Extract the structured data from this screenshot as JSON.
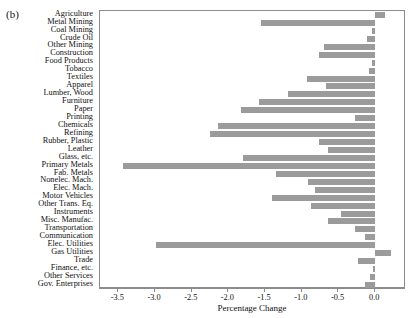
{
  "figure": {
    "panel_label": "(b)"
  },
  "chart_data": {
    "type": "bar",
    "orientation": "horizontal",
    "title": "",
    "subtitle": "",
    "xlabel": "Percentage Change",
    "ylabel": "",
    "xlim": [
      -3.75,
      0.42
    ],
    "ylim": [
      0,
      33
    ],
    "grid": false,
    "legend": null,
    "bar_color": "#9b9b9b",
    "axis_color": "#8c8c8c",
    "xticks": [
      -3.5,
      -3.0,
      -2.5,
      -2.0,
      -1.5,
      -1.0,
      -0.5,
      0.0
    ],
    "xticklabels": [
      "-3.5",
      "-3.0",
      "-2.5",
      "-2.0",
      "-1.5",
      "-1.0",
      "-0.5",
      "0.0"
    ],
    "categories": [
      "Agriculture",
      "Metal Mining",
      "Coal Mining",
      "Crude Oil",
      "Other Mining",
      "Construction",
      "Food Products",
      "Tobacco",
      "Textiles",
      "Apparel",
      "Lumber, Wood",
      "Furniture",
      "Paper",
      "Printing",
      "Chemicals",
      "Refining",
      "Rubber, Plastic",
      "Leather",
      "Glass, etc.",
      "Primary Metals",
      "Fab. Metals",
      "Nonelec. Mach.",
      "Elec. Mach.",
      "Motor Vehicles",
      "Other Trans. Eq.",
      "Instruments",
      "Misc. Manufac.",
      "Transportation",
      "Communication",
      "Elec. Utilities",
      "Gas Utilities",
      "Trade",
      "Finance, etc.",
      "Other Services",
      "Gov. Enterprises"
    ],
    "values": [
      0.13,
      -1.55,
      -0.05,
      -0.11,
      -0.7,
      -0.76,
      -0.05,
      -0.09,
      -0.93,
      -0.67,
      -1.19,
      -1.59,
      -1.83,
      -0.28,
      -2.14,
      -2.25,
      -0.77,
      -0.64,
      -1.8,
      -3.43,
      -1.35,
      -0.92,
      -0.82,
      -1.4,
      -0.88,
      -0.47,
      -0.64,
      -0.27,
      -0.14,
      -2.99,
      0.22,
      -0.24,
      -0.03,
      -0.07,
      -0.14
    ]
  }
}
